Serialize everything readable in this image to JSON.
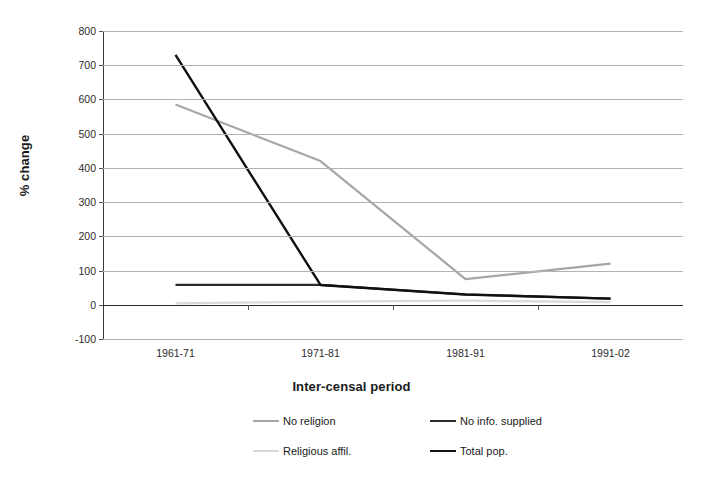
{
  "chart_data": {
    "type": "line",
    "title": "",
    "xlabel": "Inter-censal period",
    "ylabel": "% change",
    "categories": [
      "1961-71",
      "1971-81",
      "1981-91",
      "1991-02"
    ],
    "ylim": [
      -100,
      800
    ],
    "ytick_labels": [
      "800",
      "700",
      "600",
      "500",
      "400",
      "300",
      "200",
      "100",
      "0",
      "-100"
    ],
    "ytick_values": [
      800,
      700,
      600,
      500,
      400,
      300,
      200,
      100,
      0,
      -100
    ],
    "grid": true,
    "legend_position": "bottom",
    "series": [
      {
        "name": "No religion",
        "values": [
          585,
          420,
          75,
          120
        ],
        "color": "#a6a6a6",
        "width": 2.2
      },
      {
        "name": "No info. supplied",
        "values": [
          58,
          58,
          30,
          18
        ],
        "color": "#2b2b2b",
        "width": 2.2
      },
      {
        "name": "Religious affil.",
        "values": [
          4,
          9,
          12,
          8
        ],
        "color": "#d9d9d9",
        "width": 2.2
      },
      {
        "name": "Total pop.",
        "values": [
          730,
          58,
          30,
          18
        ],
        "color": "#111111",
        "width": 2.4
      }
    ]
  },
  "axes": {
    "y_title": "% change",
    "x_title": "Inter-censal period",
    "y_labels": [
      "800",
      "700",
      "600",
      "500",
      "400",
      "300",
      "200",
      "100",
      "0",
      "-100"
    ],
    "x_labels": [
      "1961-71",
      "1971-81",
      "1981-91",
      "1991-02"
    ]
  },
  "legend": {
    "items": [
      {
        "label": "No religion",
        "color": "#a6a6a6"
      },
      {
        "label": "No info. supplied",
        "color": "#2b2b2b"
      },
      {
        "label": "Religious affil.",
        "color": "#d9d9d9"
      },
      {
        "label": "Total pop.",
        "color": "#111111"
      }
    ]
  },
  "colors": {
    "gridline": "#b3b3b3",
    "axis": "#3a3a3a",
    "text": "#1a1a1a",
    "background": "#ffffff"
  }
}
